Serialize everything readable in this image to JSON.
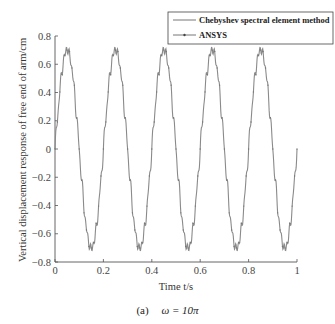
{
  "chart_data": {
    "type": "line",
    "title": "",
    "xlabel": "Time t/s",
    "ylabel": "Vertical displacement response of free end of arm/cm",
    "xlim": [
      0,
      1
    ],
    "ylim": [
      -0.8,
      0.8
    ],
    "xticks": [
      0,
      0.2,
      0.4,
      0.6,
      0.8,
      1
    ],
    "xtick_labels": [
      "0",
      "0.2",
      "0.4",
      "0.6",
      "0.8",
      "1"
    ],
    "yticks": [
      0.8,
      0.6,
      0.4,
      0.2,
      0,
      -0.2,
      -0.4,
      -0.6,
      -0.8
    ],
    "ytick_labels": [
      "0.8",
      "0.6",
      "0.4",
      "0.2",
      "0",
      "-0.2",
      "-0.4",
      "-0.6",
      "-0.8"
    ],
    "grid": false,
    "legend_position": "upper right (outside top)",
    "series": [
      {
        "name": "Chebyshev spectral element method",
        "description": "Sinusoid with ~0.2 s period (omega = 10pi), amplitude ~0.7, with small high-frequency ripple",
        "amplitude": 0.7,
        "period": 0.2,
        "x": [
          0,
          0.05,
          0.1,
          0.15,
          0.2,
          0.25,
          0.3,
          0.35,
          0.4,
          0.45,
          0.5,
          0.55,
          0.6,
          0.65,
          0.7,
          0.75,
          0.8,
          0.85,
          0.9,
          0.95,
          1.0
        ],
        "values": [
          0,
          0.7,
          0,
          -0.7,
          0,
          0.7,
          0,
          -0.7,
          0,
          0.7,
          0,
          -0.7,
          0,
          0.7,
          0,
          -0.7,
          0,
          0.7,
          0,
          -0.7,
          -0.05
        ]
      },
      {
        "name": "ANSYS",
        "description": "Overlapping curve with point markers, matching Chebyshev result",
        "amplitude": 0.7,
        "period": 0.2,
        "x": [
          0,
          0.05,
          0.1,
          0.15,
          0.2,
          0.25,
          0.3,
          0.35,
          0.4,
          0.45,
          0.5,
          0.55,
          0.6,
          0.65,
          0.7,
          0.75,
          0.8,
          0.85,
          0.9,
          0.95,
          1.0
        ],
        "values": [
          0,
          0.7,
          0,
          -0.7,
          0,
          0.7,
          0,
          -0.7,
          0,
          0.7,
          0,
          -0.7,
          0,
          0.7,
          0,
          -0.7,
          0,
          0.7,
          0,
          -0.7,
          -0.05
        ]
      }
    ],
    "caption": "(a)   ω = 10π"
  },
  "legend": {
    "items": [
      {
        "label": "Chebyshev spectral element method"
      },
      {
        "label": "ANSYS"
      }
    ]
  },
  "caption": {
    "tag": "(a)",
    "formula": "ω = 10π"
  },
  "colors": {
    "line": "#8a8a8a",
    "axis": "#555555"
  }
}
